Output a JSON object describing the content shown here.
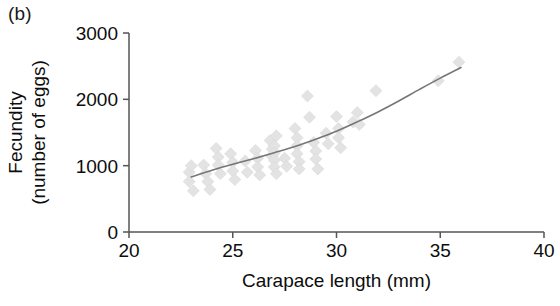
{
  "figure": {
    "panel_label": "(b)",
    "background_color": "#ffffff"
  },
  "chart_data": {
    "type": "scatter",
    "title": "",
    "panel": "(b)",
    "xlabel": "Carapace length (mm)",
    "ylabel": "Fecundity\n(number of eggs)",
    "ylabel_line1": "Fecundity",
    "ylabel_line2": "(number of eggs)",
    "xlim": [
      20,
      40
    ],
    "ylim": [
      0,
      3000
    ],
    "xticks": [
      20,
      25,
      30,
      35,
      40
    ],
    "xtick_labels": [
      "20",
      "25",
      "30",
      "35",
      "40"
    ],
    "yticks": [
      0,
      1000,
      2000,
      3000
    ],
    "ytick_labels": [
      "0",
      "1000",
      "2000",
      "3000"
    ],
    "grid": false,
    "legend": "none",
    "marker": "diamond",
    "marker_color": "#e3e3e3",
    "marker_size": 12,
    "axis_color": "#555555",
    "trendline": {
      "present": true,
      "style": "solid-curve",
      "color": "#767676",
      "width": 1.6,
      "points": [
        [
          23.0,
          830
        ],
        [
          24.0,
          930
        ],
        [
          25.0,
          1020
        ],
        [
          26.0,
          1105
        ],
        [
          27.0,
          1195
        ],
        [
          28.0,
          1290
        ],
        [
          29.0,
          1400
        ],
        [
          30.0,
          1520
        ],
        [
          31.0,
          1660
        ],
        [
          32.0,
          1810
        ],
        [
          33.0,
          1975
        ],
        [
          34.0,
          2150
        ],
        [
          35.0,
          2320
        ],
        [
          36.0,
          2480
        ]
      ]
    },
    "points": [
      [
        22.9,
        900
      ],
      [
        22.9,
        760
      ],
      [
        23.0,
        1000
      ],
      [
        23.1,
        620
      ],
      [
        23.6,
        1010
      ],
      [
        23.7,
        880
      ],
      [
        23.8,
        760
      ],
      [
        23.9,
        640
      ],
      [
        24.2,
        1260
      ],
      [
        24.3,
        1130
      ],
      [
        24.3,
        1010
      ],
      [
        24.4,
        880
      ],
      [
        24.9,
        1180
      ],
      [
        25.0,
        1050
      ],
      [
        25.0,
        920
      ],
      [
        25.1,
        790
      ],
      [
        25.6,
        1070
      ],
      [
        25.7,
        900
      ],
      [
        26.1,
        1230
      ],
      [
        26.2,
        1110
      ],
      [
        26.2,
        980
      ],
      [
        26.3,
        860
      ],
      [
        26.8,
        1380
      ],
      [
        26.9,
        1250
      ],
      [
        26.9,
        1140
      ],
      [
        27.0,
        1300
      ],
      [
        27.0,
        1190
      ],
      [
        27.0,
        1080
      ],
      [
        27.0,
        980
      ],
      [
        27.1,
        880
      ],
      [
        27.1,
        1450
      ],
      [
        27.5,
        1110
      ],
      [
        27.6,
        990
      ],
      [
        28.0,
        1560
      ],
      [
        28.1,
        1420
      ],
      [
        28.1,
        1300
      ],
      [
        28.1,
        1180
      ],
      [
        28.2,
        1060
      ],
      [
        28.2,
        950
      ],
      [
        28.6,
        2050
      ],
      [
        28.7,
        1730
      ],
      [
        28.9,
        1350
      ],
      [
        29.0,
        1220
      ],
      [
        29.0,
        1100
      ],
      [
        29.1,
        950
      ],
      [
        29.5,
        1490
      ],
      [
        29.6,
        1330
      ],
      [
        30.0,
        1740
      ],
      [
        30.1,
        1560
      ],
      [
        30.1,
        1420
      ],
      [
        30.2,
        1270
      ],
      [
        30.8,
        1660
      ],
      [
        31.0,
        1800
      ],
      [
        31.1,
        1620
      ],
      [
        31.9,
        2130
      ],
      [
        34.9,
        2280
      ],
      [
        35.9,
        2560
      ]
    ]
  }
}
